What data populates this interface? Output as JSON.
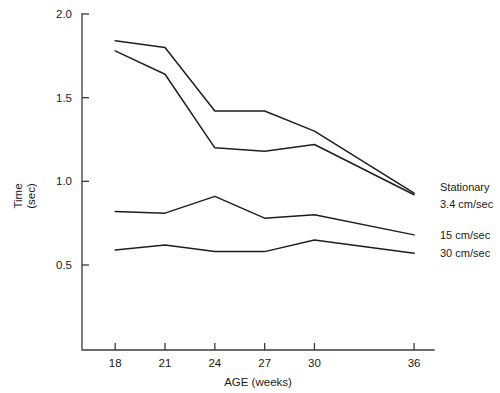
{
  "chart_data": {
    "type": "line",
    "title": "",
    "xlabel": "AGE (weeks)",
    "ylabel_line1": "Time",
    "ylabel_line2": "(sec)",
    "x": [
      18,
      21,
      24,
      27,
      30,
      36
    ],
    "xtick_labels": [
      "18",
      "21",
      "24",
      "27",
      "30",
      "36"
    ],
    "ytick_labels": [
      "0.5",
      "1.0",
      "1.5",
      "2.0"
    ],
    "ytick_values": [
      0.5,
      1.0,
      1.5,
      2.0
    ],
    "ylim": [
      0.0,
      2.0
    ],
    "xlim": [
      16.0,
      37.2
    ],
    "grid": false,
    "legend_position": "right-inline",
    "series": [
      {
        "name": "Stationary",
        "label": "Stationary",
        "values": [
          1.84,
          1.8,
          1.42,
          1.42,
          1.3,
          0.93
        ]
      },
      {
        "name": "3.4 cm/sec",
        "label": "3.4 cm/sec",
        "values": [
          1.78,
          1.64,
          1.2,
          1.18,
          1.22,
          0.92
        ]
      },
      {
        "name": "15 cm/sec",
        "label": "15 cm/sec",
        "values": [
          0.82,
          0.81,
          0.91,
          0.78,
          0.8,
          0.68
        ]
      },
      {
        "name": "30 cm/sec",
        "label": "30 cm/sec",
        "values": [
          0.59,
          0.62,
          0.58,
          0.58,
          0.65,
          0.57
        ]
      }
    ],
    "colors": {
      "line": "#1e1e1e",
      "axis": "#3a3a3a",
      "text": "#1a1a1a",
      "background": "#ffffff"
    }
  }
}
